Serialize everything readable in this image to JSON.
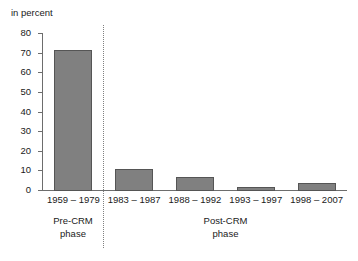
{
  "chart_data": {
    "type": "bar",
    "title": "",
    "ylabel": "in percent",
    "xlabel": "",
    "ylim": [
      0,
      80
    ],
    "yticks": [
      "0",
      "10",
      "20",
      "30",
      "40",
      "50",
      "60",
      "70",
      "80"
    ],
    "grid": false,
    "legend": null,
    "categories": [
      "1959 – 1979",
      "1983 – 1987",
      "1988 – 1992",
      "1993 – 1997",
      "1998 – 2007"
    ],
    "values": [
      72,
      11,
      7,
      2,
      4
    ],
    "series": [
      {
        "name": "in percent",
        "values": [
          72,
          11,
          7,
          2,
          4
        ]
      }
    ],
    "annotations": [
      {
        "label": "Pre-CRM\nphase",
        "covers": [
          "1959 – 1979"
        ]
      },
      {
        "label": "Post-CRM\nphase",
        "covers": [
          "1983 – 1987",
          "1988 – 1992",
          "1993 – 1997",
          "1998 – 2007"
        ]
      }
    ],
    "bar_color": "#808080",
    "bar_edge_color": "#555555",
    "axis_color": "#6d6d6d",
    "divider_color": "#808080"
  },
  "axis": {
    "unit_label": "in percent",
    "y_tick_labels": [
      "80",
      "70",
      "60",
      "50",
      "40",
      "30",
      "20",
      "10",
      "0"
    ]
  },
  "categories": [
    {
      "label": "1959 – 1979"
    },
    {
      "label": "1983 – 1987"
    },
    {
      "label": "1988 – 1992"
    },
    {
      "label": "1993 – 1997"
    },
    {
      "label": "1998 – 2007"
    }
  ],
  "phases": [
    {
      "name": "Pre-CRM",
      "line1": "Pre-CRM",
      "line2": "phase"
    },
    {
      "name": "Post-CRM",
      "line1": "Post-CRM",
      "line2": "phase"
    }
  ]
}
